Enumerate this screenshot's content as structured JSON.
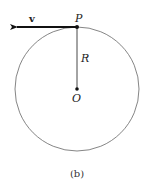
{
  "diagram": {
    "circle": {
      "cx": 77,
      "cy": 89,
      "r": 62,
      "stroke": "#666666"
    },
    "center": {
      "label": "O",
      "x": 77,
      "y": 89
    },
    "point": {
      "label": "P",
      "x": 77,
      "y": 27
    },
    "radius_label": "R",
    "velocity": {
      "label": "v",
      "from_x": 77,
      "to_x": 15,
      "y": 27
    },
    "caption": "(b)"
  }
}
